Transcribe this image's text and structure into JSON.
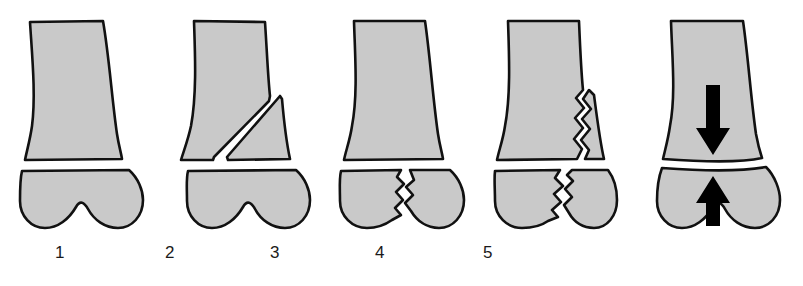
{
  "illustration": {
    "title": "Distal femur fracture classification series",
    "background_color": "#ffffff",
    "bone_fill_color": "#c9c9c9",
    "bone_outline_color": "#111111",
    "arrow_color": "#000000",
    "label_color": "#1a1a1a",
    "figures": [
      {
        "label": "1",
        "name": "intact-distal-femur",
        "description": "Intact distal femoral shaft and condyle, no fracture line",
        "left": 8,
        "label_left": 30
      },
      {
        "label": "2",
        "name": "oblique-wedge-fracture",
        "description": "Oblique supracondylar fracture producing a triangular lateral wedge fragment",
        "left": 170,
        "label_left": 140
      },
      {
        "label": "3",
        "name": "intercondylar-split-fracture",
        "description": "Transverse supracondylar fracture with vertical zigzag intercondylar split",
        "left": 328,
        "label_left": 245
      },
      {
        "label": "4",
        "name": "comminuted-shaft-extension-fracture",
        "description": "Intercondylar split extending proximally into the metaphyseal shaft",
        "left": 480,
        "label_left": 350
      },
      {
        "label": "5",
        "name": "impacted-compression-fracture",
        "description": "Impacted supracondylar fracture with axial compression arrows",
        "left": 645,
        "label_left": 458
      }
    ],
    "annotations": {
      "down_arrow": "down-arrow",
      "up_arrow": "up-arrow"
    }
  }
}
